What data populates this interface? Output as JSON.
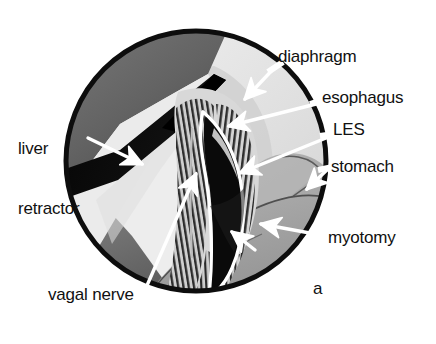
{
  "figure": {
    "panel_letter": "a",
    "type": "medical-illustration",
    "viewport": {
      "shape": "circle",
      "center_x": 196,
      "center_y": 161,
      "radius": 131
    },
    "palette": {
      "outline": "#0d0d0d",
      "liver": "#6d6d6d",
      "liver_dark": "#4a4a4a",
      "retractor_blade": "#0b0b0b",
      "diaphragm": "#e2e2e2",
      "diaphragm_shadow": "#c9c9c9",
      "esophagus": "#d2d2d2",
      "muscle_fiber": "#2b2b2b",
      "myotomy_opening": "#0b0b0b",
      "stomach": "#a9a9a9",
      "stomach_outline": "#555555",
      "background": "#ffffff",
      "leader_line": "#ffffff",
      "label_text": "#111111"
    },
    "labels": [
      {
        "id": "liver-retractor",
        "text": "liver\nretractor",
        "lines": [
          "liver",
          "retractor"
        ],
        "x": 18,
        "y": 99,
        "align": "left",
        "arrow_from_x": 88,
        "arrow_from_y": 138,
        "arrow_to_x": 140,
        "arrow_to_y": 163
      },
      {
        "id": "diaphragm",
        "text": "diaphragm",
        "lines": [
          "diaphragm"
        ],
        "x": 278,
        "y": 47,
        "align": "left",
        "arrow_from_x": 276,
        "arrow_from_y": 66,
        "arrow_to_x": 243,
        "arrow_to_y": 98
      },
      {
        "id": "esophagus",
        "text": "esophagus",
        "lines": [
          "esophagus"
        ],
        "x": 322,
        "y": 88,
        "align": "left",
        "arrow_from_x": 320,
        "arrow_from_y": 103,
        "arrow_to_x": 227,
        "arrow_to_y": 126
      },
      {
        "id": "les",
        "text": "LES",
        "lines": [
          "LES"
        ],
        "x": 333,
        "y": 120,
        "align": "left",
        "arrow_from_x": 331,
        "arrow_from_y": 136,
        "arrow_to_x": 238,
        "arrow_to_y": 173
      },
      {
        "id": "stomach",
        "text": "stomach",
        "lines": [
          "stomach"
        ],
        "x": 331,
        "y": 157,
        "align": "left",
        "arrow_from_x": 329,
        "arrow_from_y": 168,
        "arrow_to_x": 305,
        "arrow_to_y": 189
      },
      {
        "id": "myotomy",
        "text": "myotomy",
        "lines": [
          "myotomy"
        ],
        "x": 328,
        "y": 228,
        "align": "left",
        "arrow_from_x": 326,
        "arrow_from_y": 236,
        "arrow_to_x": 258,
        "arrow_to_y": 224
      },
      {
        "id": "vagal-nerve",
        "text": "vagal nerve",
        "lines": [
          "vagal nerve"
        ],
        "x": 48,
        "y": 285,
        "align": "left",
        "arrow_from_x": 145,
        "arrow_from_y": 290,
        "arrow_to_x": 197,
        "arrow_to_y": 172
      }
    ],
    "structures": [
      {
        "id": "liver",
        "name": "liver"
      },
      {
        "id": "liver-retractor-blade",
        "name": "liver retractor blade"
      },
      {
        "id": "diaphragm",
        "name": "diaphragm"
      },
      {
        "id": "esophagus",
        "name": "esophagus"
      },
      {
        "id": "esophageal-muscle-fibers",
        "name": "esophageal muscle fibers"
      },
      {
        "id": "les",
        "name": "lower esophageal sphincter"
      },
      {
        "id": "myotomy-opening",
        "name": "myotomy incision"
      },
      {
        "id": "stomach",
        "name": "stomach"
      },
      {
        "id": "vagal-nerve",
        "name": "vagal nerve"
      }
    ]
  }
}
